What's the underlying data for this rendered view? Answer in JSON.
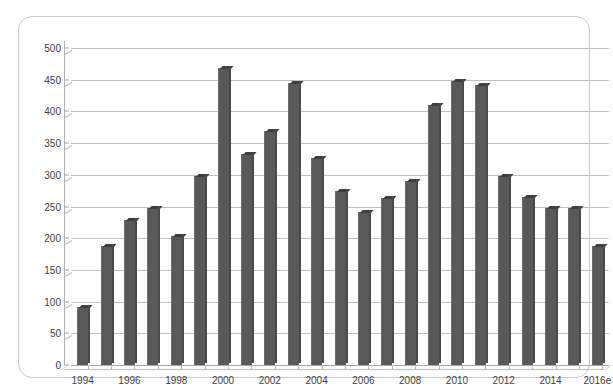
{
  "chart_data": {
    "type": "bar",
    "title": "",
    "subtitle": "",
    "xlabel": "",
    "ylabel": "",
    "ylim": [
      0,
      500
    ],
    "ytick_step": 50,
    "yticks": [
      0,
      50,
      100,
      150,
      200,
      250,
      300,
      350,
      400,
      450,
      500
    ],
    "ytick_labels": [
      "0",
      "50",
      "100",
      "150",
      "200",
      "250",
      "300",
      "350",
      "400",
      "450",
      "500"
    ],
    "grid": true,
    "legend": null,
    "legend_position": "none",
    "bar_color": "#595959",
    "plot_background": "#ffffff",
    "grid_color": "#bfbfbf",
    "axis_color": "#a6a6a6",
    "categories": [
      "1994",
      "1995",
      "1996",
      "1997",
      "1998",
      "1999",
      "2000",
      "2001",
      "2002",
      "2003",
      "2004",
      "2005",
      "2006",
      "2007",
      "2008",
      "2009",
      "2010",
      "2011",
      "2012",
      "2013",
      "2014",
      "2015",
      "2016e"
    ],
    "xtick_labels_shown": [
      "1994",
      "1996",
      "1998",
      "2000",
      "2002",
      "2004",
      "2006",
      "2008",
      "2010",
      "2012",
      "2014",
      "2016e"
    ],
    "values": [
      92,
      187,
      228,
      248,
      203,
      298,
      468,
      333,
      369,
      445,
      327,
      275,
      241,
      263,
      291,
      410,
      448,
      441,
      298,
      265,
      248,
      248,
      188
    ],
    "annotations": []
  }
}
